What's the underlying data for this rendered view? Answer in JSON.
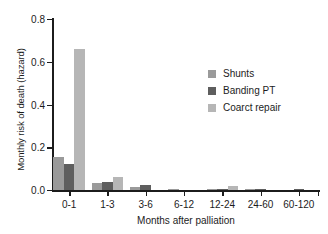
{
  "chart_data": {
    "type": "bar",
    "title": "",
    "subtitle": "",
    "xlabel": "Months after palliation",
    "ylabel": "Monthly risk of death (hazard)",
    "categories": [
      "0-1",
      "1-3",
      "3-6",
      "6-12",
      "12-24",
      "24-60",
      "60-120"
    ],
    "series": [
      {
        "name": "Shunts",
        "color": "#9a9a9a",
        "values": [
          0.155,
          0.035,
          0.013,
          0.002,
          0.001,
          0.001,
          0.0
        ]
      },
      {
        "name": "Banding PT",
        "color": "#5e5e5e",
        "values": [
          0.122,
          0.038,
          0.024,
          0.0,
          0.006,
          0.007,
          0.004
        ]
      },
      {
        "name": "Coarct repair",
        "color": "#b6b6b6",
        "values": [
          0.66,
          0.062,
          0.0,
          0.0,
          0.021,
          0.0,
          0.0
        ]
      }
    ],
    "ylim": [
      0.0,
      0.8
    ],
    "yticks": [
      "0.0",
      "0.2",
      "0.4",
      "0.6",
      "0.8"
    ],
    "ytick_values": [
      0.0,
      0.2,
      0.4,
      0.6,
      0.8
    ],
    "grid": false,
    "legend_position": "upper-right",
    "axis_color": "#1c1c1c",
    "background_color": "#ffffff"
  }
}
